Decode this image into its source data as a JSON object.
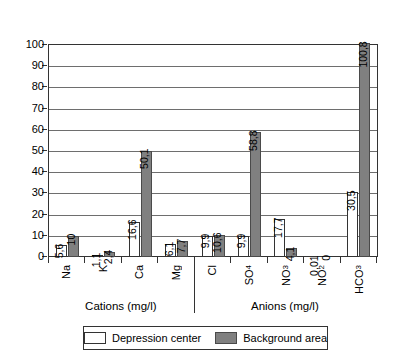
{
  "chart_data": {
    "type": "bar",
    "title": "",
    "xlabel": "",
    "ylabel": "",
    "ylim": [
      0,
      100
    ],
    "yticks": [
      0,
      10,
      20,
      30,
      40,
      50,
      60,
      70,
      80,
      90,
      100
    ],
    "grid": true,
    "legend_position": "bottom",
    "categories": [
      "Na",
      "K",
      "Ca",
      "Mg",
      "Cl",
      "SO4",
      "NO3",
      "NO2",
      "HCO3"
    ],
    "category_labels": [
      {
        "base": "Na",
        "sub": ""
      },
      {
        "base": "K",
        "sub": ""
      },
      {
        "base": "Ca",
        "sub": ""
      },
      {
        "base": "Mg",
        "sub": ""
      },
      {
        "base": "Cl",
        "sub": ""
      },
      {
        "base": "SO",
        "sub": "4"
      },
      {
        "base": "NO",
        "sub": "3"
      },
      {
        "base": "NO",
        "sub": "2"
      },
      {
        "base": "HCO",
        "sub": "3"
      }
    ],
    "series": [
      {
        "name": "Depression center",
        "color": "#ffffff",
        "values": [
          5.6,
          1.1,
          16.6,
          6.1,
          9.9,
          9.9,
          17.7,
          0.01,
          30.5
        ],
        "labels": [
          "5,6",
          "1,1",
          "16,6",
          "6,1",
          "9,9",
          "9,9",
          "17,7",
          "0,01",
          "30,5"
        ]
      },
      {
        "name": "Background area",
        "color": "#808080",
        "values": [
          10,
          2.4,
          50.1,
          7.7,
          10.6,
          58.8,
          4.1,
          0,
          100.8
        ],
        "labels": [
          "10",
          "2,4",
          "50,1",
          "7,7",
          "10,6",
          "58,8",
          "4,1",
          "0",
          "100,8"
        ]
      }
    ],
    "groups": [
      {
        "caption": "Cations (mg/l)",
        "categories": [
          "Na",
          "K",
          "Ca",
          "Mg"
        ]
      },
      {
        "caption": "Anions (mg/l)",
        "categories": [
          "Cl",
          "SO4",
          "NO3",
          "NO2",
          "HCO3"
        ]
      }
    ]
  },
  "legend": {
    "items": [
      {
        "label": "Depression center",
        "swatch": "depression"
      },
      {
        "label": "Background area",
        "swatch": "background"
      }
    ]
  },
  "sections": {
    "cations_caption": "Cations (mg/l)",
    "anions_caption": "Anions (mg/l)"
  },
  "colors": {
    "depression_center": "#ffffff",
    "background_area": "#808080",
    "axis": "#333333",
    "gridline": "#6e6e6e"
  }
}
